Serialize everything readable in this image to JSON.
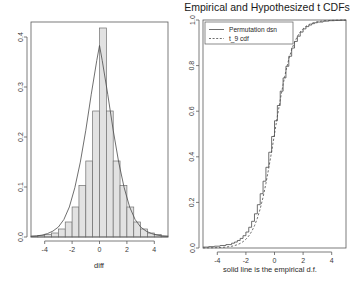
{
  "figure": {
    "width": 356,
    "height": 284,
    "background": "#ffffff",
    "panels": 2
  },
  "chart_data": [
    {
      "id": "left-histogram",
      "type": "bar",
      "title": "",
      "xlabel": "diff",
      "ylabel": "",
      "xlim": [
        -5,
        5
      ],
      "ylim": [
        0,
        0.43
      ],
      "grid": false,
      "legend": null,
      "xticks": [
        -4,
        -2,
        0,
        2,
        4
      ],
      "xtick_labels": [
        "-4",
        "-2",
        "0",
        "2",
        "4"
      ],
      "yticks": [
        0.0,
        0.1,
        0.2,
        0.3,
        0.4
      ],
      "ytick_labels": [
        "0.0",
        "0.1",
        "0.2",
        "0.3",
        "0.4"
      ],
      "bin_width": 0.5,
      "bin_edges": [
        -5.0,
        -4.5,
        -4.0,
        -3.5,
        -3.0,
        -2.5,
        -2.0,
        -1.5,
        -1.0,
        -0.5,
        0.0,
        0.5,
        1.0,
        1.5,
        2.0,
        2.5,
        3.0,
        3.5,
        4.0,
        4.5,
        5.0
      ],
      "bin_centers": [
        -4.75,
        -4.25,
        -3.75,
        -3.25,
        -2.75,
        -2.25,
        -1.75,
        -1.25,
        -0.75,
        -0.25,
        0.25,
        0.75,
        1.25,
        1.75,
        2.25,
        2.75,
        3.25,
        3.75,
        4.25,
        4.75
      ],
      "values": [
        0.002,
        0.003,
        0.005,
        0.008,
        0.016,
        0.03,
        0.06,
        0.103,
        0.152,
        0.252,
        0.418,
        0.252,
        0.152,
        0.103,
        0.06,
        0.03,
        0.016,
        0.008,
        0.005,
        0.002
      ],
      "density_overlay": {
        "name": "normal density curve",
        "x": [
          -5.0,
          -4.6,
          -4.2,
          -3.8,
          -3.4,
          -3.0,
          -2.6,
          -2.2,
          -1.8,
          -1.4,
          -1.0,
          -0.6,
          -0.2,
          0.0,
          0.2,
          0.6,
          1.0,
          1.4,
          1.8,
          2.2,
          2.6,
          3.0,
          3.4,
          3.8,
          4.2,
          4.6,
          5.0
        ],
        "y": [
          0.0012,
          0.0021,
          0.0038,
          0.0068,
          0.0118,
          0.02,
          0.035,
          0.0601,
          0.0986,
          0.1497,
          0.2135,
          0.2856,
          0.3529,
          0.383,
          0.3529,
          0.2856,
          0.2135,
          0.1497,
          0.0986,
          0.0601,
          0.035,
          0.02,
          0.0118,
          0.0068,
          0.0038,
          0.0021,
          0.0012
        ]
      }
    },
    {
      "id": "right-cdf",
      "type": "line",
      "title": "Empirical and Hypothesized t CDFs",
      "xlabel": "solid line is the empirical d.f.",
      "ylabel": "",
      "xlim": [
        -5,
        5
      ],
      "ylim": [
        0,
        1
      ],
      "grid": false,
      "legend_position": "top-left",
      "xticks": [
        -4,
        -2,
        0,
        2,
        4
      ],
      "xtick_labels": [
        "-4",
        "-2",
        "0",
        "2",
        "4"
      ],
      "yticks": [
        0.0,
        0.2,
        0.4,
        0.6,
        0.8,
        1.0
      ],
      "ytick_labels": [
        "0.0",
        "0.2",
        "0.4",
        "0.6",
        "0.8",
        "1.0"
      ],
      "series": [
        {
          "name": "Permutation dsn",
          "style": "solid",
          "x": [
            -5.0,
            -4.6,
            -4.2,
            -3.8,
            -3.4,
            -3.0,
            -2.8,
            -2.6,
            -2.4,
            -2.2,
            -2.0,
            -1.8,
            -1.6,
            -1.4,
            -1.2,
            -1.0,
            -0.8,
            -0.6,
            -0.4,
            -0.2,
            0.0,
            0.2,
            0.4,
            0.6,
            0.8,
            1.0,
            1.2,
            1.4,
            1.6,
            1.8,
            2.0,
            2.2,
            2.4,
            2.6,
            2.8,
            3.0,
            3.4,
            3.8,
            4.2,
            4.6,
            5.0
          ],
          "y": [
            0.004,
            0.006,
            0.008,
            0.011,
            0.015,
            0.021,
            0.026,
            0.033,
            0.042,
            0.054,
            0.07,
            0.091,
            0.117,
            0.15,
            0.19,
            0.238,
            0.293,
            0.354,
            0.42,
            0.489,
            0.558,
            0.625,
            0.688,
            0.746,
            0.797,
            0.841,
            0.877,
            0.906,
            0.929,
            0.947,
            0.961,
            0.971,
            0.978,
            0.984,
            0.988,
            0.991,
            0.995,
            0.997,
            0.998,
            0.999,
            1.0
          ]
        },
        {
          "name": "t_9 cdf",
          "style": "dashed",
          "x": [
            -5.0,
            -4.6,
            -4.2,
            -3.8,
            -3.4,
            -3.0,
            -2.8,
            -2.6,
            -2.4,
            -2.2,
            -2.0,
            -1.8,
            -1.6,
            -1.4,
            -1.2,
            -1.0,
            -0.8,
            -0.6,
            -0.4,
            -0.2,
            0.0,
            0.2,
            0.4,
            0.6,
            0.8,
            1.0,
            1.2,
            1.4,
            1.6,
            1.8,
            2.0,
            2.2,
            2.4,
            2.6,
            2.8,
            3.0,
            3.4,
            3.8,
            4.2,
            4.6,
            5.0
          ],
          "y": [
            0.0004,
            0.0007,
            0.0012,
            0.0021,
            0.0039,
            0.0075,
            0.0105,
            0.0145,
            0.0201,
            0.0277,
            0.0383,
            0.0527,
            0.0721,
            0.0975,
            0.1302,
            0.1717,
            0.2227,
            0.283,
            0.3511,
            0.423,
            0.5,
            0.577,
            0.6489,
            0.717,
            0.7773,
            0.8283,
            0.8698,
            0.9025,
            0.9279,
            0.9473,
            0.9617,
            0.9723,
            0.9799,
            0.9855,
            0.9895,
            0.9925,
            0.9961,
            0.9979,
            0.9988,
            0.9993,
            0.9996
          ]
        }
      ]
    }
  ],
  "left_panel": {
    "name": "histogram-panel",
    "xlabel": "diff",
    "xtick_labels": [
      "-4",
      "-2",
      "0",
      "2",
      "4"
    ],
    "ytick_labels": [
      "0.0",
      "0.1",
      "0.2",
      "0.3",
      "0.4"
    ]
  },
  "right_panel": {
    "name": "cdf-panel",
    "title": "Empirical and Hypothesized t CDFs",
    "xlabel": "solid line is the empirical d.f.",
    "xtick_labels": [
      "-4",
      "-2",
      "0",
      "2",
      "4"
    ],
    "ytick_labels": [
      "0.0",
      "0.2",
      "0.4",
      "0.6",
      "0.8",
      "1.0"
    ],
    "legend": {
      "entries": [
        {
          "label": "Permutation dsn",
          "style": "solid"
        },
        {
          "label": "t_9 cdf",
          "style": "dashed"
        }
      ]
    }
  },
  "colors": {
    "background": "#ffffff",
    "axis": "#5a5a5a",
    "bar_fill": "#e2e2e2",
    "bar_stroke": "#707070",
    "curve": "#4a4a4a",
    "text": "#1a1a1a"
  }
}
